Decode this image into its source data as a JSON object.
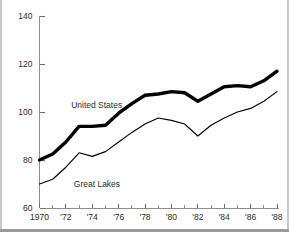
{
  "chart_data": {
    "type": "line",
    "title": "",
    "subtitle": "",
    "xlabel": "",
    "ylabel": "",
    "xlim": [
      1970,
      1988
    ],
    "ylim": [
      60,
      140
    ],
    "grid": false,
    "legend_position": "inline-annotation",
    "x": [
      1970,
      1971,
      1972,
      1973,
      1974,
      1975,
      1976,
      1977,
      1978,
      1979,
      1980,
      1981,
      1982,
      1983,
      1984,
      1985,
      1986,
      1987,
      1988
    ],
    "series": [
      {
        "name": "United States",
        "style": "thick",
        "color": "#000000",
        "values": [
          80.0,
          82.5,
          87.5,
          94.0,
          94.0,
          94.5,
          99.5,
          103.5,
          107.0,
          107.5,
          108.5,
          108.0,
          104.5,
          107.5,
          110.5,
          111.0,
          110.5,
          113.0,
          117.0
        ]
      },
      {
        "name": "Great Lakes",
        "style": "thin",
        "color": "#000000",
        "values": [
          70.0,
          72.0,
          77.0,
          83.0,
          81.5,
          83.5,
          87.5,
          91.5,
          95.0,
          97.5,
          96.5,
          95.0,
          90.0,
          94.5,
          97.5,
          100.0,
          101.5,
          104.5,
          108.5
        ]
      }
    ],
    "y_ticks_major": [
      60,
      80,
      100,
      120,
      140
    ],
    "y_tick_labels": [
      "60",
      "80",
      "100",
      "120",
      "140"
    ],
    "x_ticks_major": [
      1970,
      1972,
      1974,
      1976,
      1978,
      1980,
      1982,
      1984,
      1986,
      1988
    ],
    "x_tick_labels": [
      "1970",
      "'72",
      "'74",
      "'76",
      "'78",
      "'80",
      "'82",
      "'84",
      "'86",
      "'88"
    ],
    "x_ticks_minor": [
      1971,
      1973,
      1975,
      1977,
      1979,
      1981,
      1983,
      1985,
      1987
    ],
    "annotations": [
      {
        "text": "United States",
        "x": 1972.4,
        "y": 101.5
      },
      {
        "text": "Great Lakes",
        "x": 1972.6,
        "y": 68.6
      }
    ]
  },
  "colors": {
    "background": "#ffffff",
    "axis": "#8d8d8d",
    "text": "#2b2b2b",
    "series": "#000000",
    "frame": "#9a9a9a"
  }
}
